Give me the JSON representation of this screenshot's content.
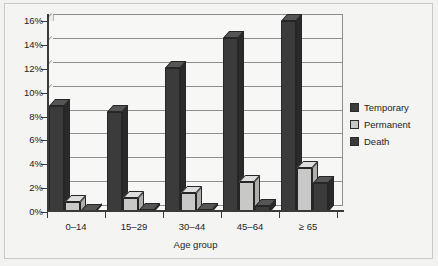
{
  "chart_data": {
    "type": "bar",
    "title": "",
    "subtitle": "",
    "xlabel": "Age group",
    "ylabel": "",
    "categories": [
      "0–14",
      "15–29",
      "30–44",
      "45–64",
      "≥ 65"
    ],
    "series": [
      {
        "name": "Temporary",
        "color": "#3b3b3b",
        "values": [
          8.9,
          8.4,
          12.1,
          14.6,
          16.0
        ]
      },
      {
        "name": "Permanent",
        "color": "#c8c8c6",
        "values": [
          0.8,
          1.2,
          1.6,
          2.5,
          3.7
        ]
      },
      {
        "name": "Death",
        "color": "#3b3b3b",
        "values": [
          0.1,
          0.15,
          0.15,
          0.5,
          2.4
        ]
      }
    ],
    "ylim": [
      0,
      16
    ],
    "ytick_values": [
      0,
      2,
      4,
      6,
      8,
      10,
      12,
      14,
      16
    ],
    "ytick_labels": [
      "0%",
      "2%",
      "4%",
      "6%",
      "8%",
      "10%",
      "12%",
      "14%",
      "16%"
    ],
    "grid": true,
    "legend_position": "right",
    "legend_entries": [
      "Temporary",
      "Permanent",
      "Death"
    ],
    "style": "3d-grouped-columns"
  }
}
